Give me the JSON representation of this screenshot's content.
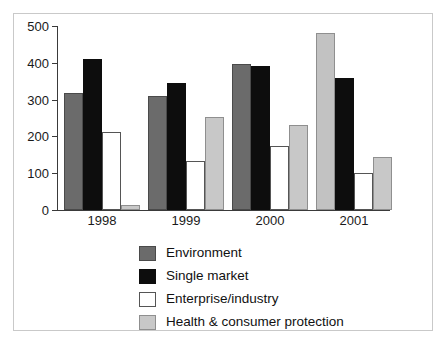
{
  "chart_data": {
    "type": "bar",
    "title": "",
    "subtitle": "",
    "xlabel": "",
    "ylabel": "",
    "categories": [
      "1998",
      "1999",
      "2000",
      "2001"
    ],
    "series": [
      {
        "name": "Environment",
        "color": "#6b6b6b",
        "values": [
          318,
          310,
          398,
          480
        ]
      },
      {
        "name": "Single market",
        "color": "#0d0d0d",
        "values": [
          410,
          345,
          392,
          358
        ]
      },
      {
        "name": "Enterprise/industry",
        "color": "#ffffff",
        "values": [
          212,
          133,
          174,
          101
        ]
      },
      {
        "name": "Health & consumer protection",
        "color": "#c8c8c8",
        "values": [
          13,
          252,
          230,
          145
        ]
      }
    ],
    "ylim": [
      0,
      500
    ],
    "yticks": [
      0,
      100,
      200,
      300,
      400,
      500
    ],
    "ytick_labels": [
      "0",
      "100",
      "200",
      "300",
      "400",
      "500"
    ],
    "grid": false,
    "legend_position": "bottom-center",
    "axis_color": "#3a3a3a",
    "frame_color": "#c9c9c9",
    "background": "#ffffff"
  },
  "legend": {
    "items": [
      {
        "label": "Environment"
      },
      {
        "label": "Single market"
      },
      {
        "label": "Enterprise/industry"
      },
      {
        "label": "Health & consumer protection"
      }
    ]
  }
}
